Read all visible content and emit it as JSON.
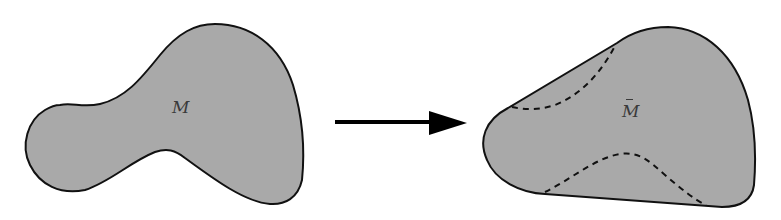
{
  "diagram": {
    "left_region": {
      "label": "M",
      "fill": "#a9a9a9",
      "stroke": "#111111"
    },
    "arrow": {
      "direction": "right",
      "color": "#000000"
    },
    "right_region": {
      "label": "M",
      "label_accent": "bar",
      "label_full": "M̄",
      "fill": "#a9a9a9",
      "stroke": "#111111",
      "dashed_curves": 2
    }
  }
}
